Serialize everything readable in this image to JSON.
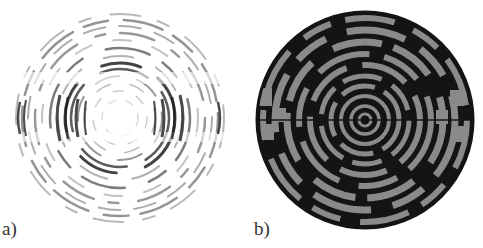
{
  "figure": {
    "panels": [
      {
        "label": "a)",
        "description": "diffraction ring pattern, grey on white, strong horizontal and vertical banding"
      },
      {
        "label": "b)",
        "description": "wrapped phase map, black and grey concentric rings with segment discontinuities"
      }
    ],
    "colors": {
      "background": "#ffffff",
      "ring_dark": "#1a1a1a",
      "ring_grey": "#7a7a7a",
      "phase_grey": "#8a8a8a",
      "phase_black": "#141414"
    }
  }
}
